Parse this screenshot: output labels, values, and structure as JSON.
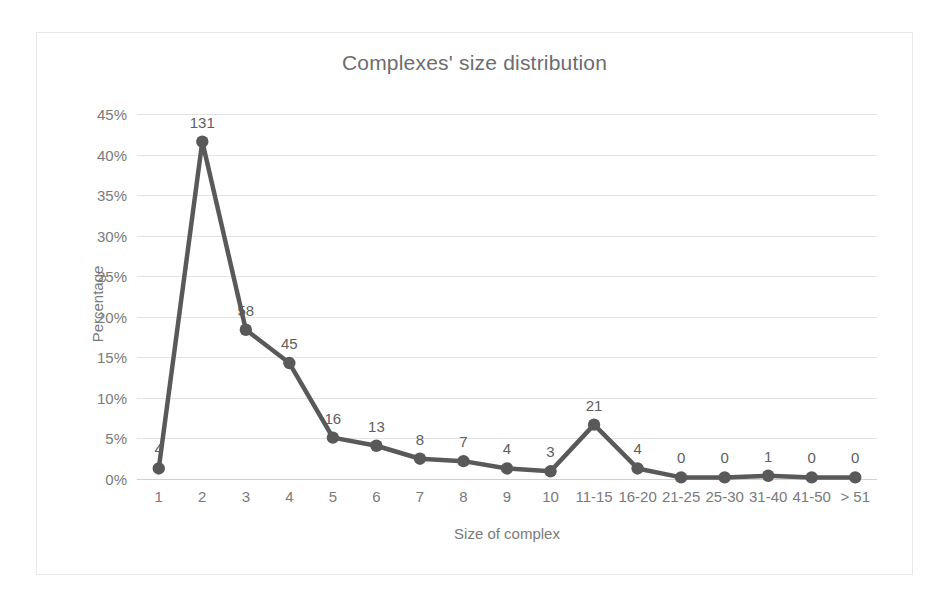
{
  "chart_data": {
    "type": "line",
    "title": "Complexes' size distribution",
    "xlabel": "Size of complex",
    "ylabel": "Percentage",
    "categories": [
      "1",
      "2",
      "3",
      "4",
      "5",
      "6",
      "7",
      "8",
      "9",
      "10",
      "11-15",
      "16-20",
      "21-25",
      "25-30",
      "31-40",
      "41-50",
      "> 51"
    ],
    "values": [
      1.3,
      41.6,
      18.4,
      14.3,
      5.1,
      4.1,
      2.5,
      2.2,
      1.3,
      0.95,
      6.7,
      1.3,
      0.2,
      0.2,
      0.4,
      0.2,
      0.2
    ],
    "counts": [
      4,
      131,
      58,
      45,
      16,
      13,
      8,
      7,
      4,
      3,
      21,
      4,
      0,
      0,
      1,
      0,
      0
    ],
    "data_labels": [
      "4",
      "131",
      "58",
      "45",
      "16",
      "13",
      "8",
      "7",
      "4",
      "3",
      "21",
      "4",
      "0",
      "0",
      "1",
      "0",
      "0"
    ],
    "ylim": [
      0,
      45
    ],
    "yticks": [
      "0%",
      "5%",
      "10%",
      "15%",
      "20%",
      "25%",
      "30%",
      "35%",
      "40%",
      "45%"
    ],
    "ytick_values": [
      0,
      5,
      10,
      15,
      20,
      25,
      30,
      35,
      40,
      45
    ],
    "grid": true,
    "legend": "none",
    "series_color": "#595959",
    "gridline_color": "#e3e3e3",
    "text_color": "#7a7a7a"
  }
}
